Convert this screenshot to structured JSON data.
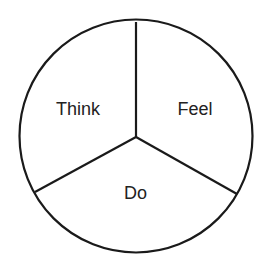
{
  "diagram": {
    "type": "circle-divided-into-three-sectors",
    "stroke_color": "#1a1a1a",
    "background": "#ffffff",
    "sectors": [
      {
        "label": "Think",
        "position": "upper-left"
      },
      {
        "label": "Feel",
        "position": "upper-right"
      },
      {
        "label": "Do",
        "position": "bottom"
      }
    ]
  }
}
